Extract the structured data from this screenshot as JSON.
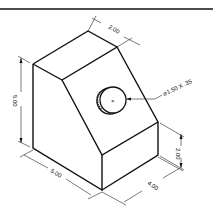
{
  "drawing": {
    "title_bar_line": true,
    "dimensions": {
      "top_depth": "2.00",
      "height_total": "5.00",
      "width_front": "5.00",
      "depth_base": "4.00",
      "height_step": "2.00",
      "hole_callout": "⌀1.50 X .35"
    },
    "hole_center_mark": "×",
    "colors": {
      "line": "#111111",
      "background": "#ffffff"
    }
  }
}
